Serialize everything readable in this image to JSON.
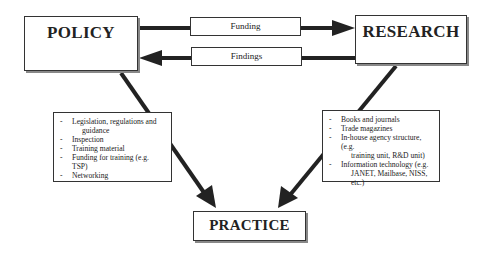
{
  "diagram": {
    "nodes": {
      "policy": {
        "label": "POLICY"
      },
      "research": {
        "label": "RESEARCH"
      },
      "practice": {
        "label": "PRACTICE"
      }
    },
    "flows": {
      "funding": {
        "label": "Funding",
        "from": "POLICY",
        "to": "RESEARCH"
      },
      "findings": {
        "label": "Findings",
        "from": "RESEARCH",
        "to": "POLICY"
      }
    },
    "policy_channels": {
      "items": [
        {
          "text": "Legislation, regulations and",
          "cont": "guidance"
        },
        {
          "text": "Inspection"
        },
        {
          "text": "Training material"
        },
        {
          "text": "Funding for training (e.g. TSP)"
        },
        {
          "text": "Networking"
        }
      ]
    },
    "research_channels": {
      "items": [
        {
          "text": "Books and journals"
        },
        {
          "text": "Trade magazines"
        },
        {
          "text": "In-house agency structure, (e.g.",
          "cont": "training unit, R&D unit)"
        },
        {
          "text": "Information technology (e.g.",
          "cont": "JANET, Mailbase, NISS, etc.)"
        }
      ]
    }
  }
}
